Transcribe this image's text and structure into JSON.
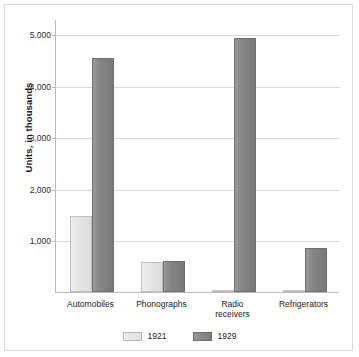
{
  "chart_data": {
    "type": "bar",
    "title": "",
    "xlabel": "",
    "ylabel": "Units, in thousands",
    "ylim": [
      0,
      5300
    ],
    "grid": true,
    "legend_position": "bottom",
    "categories": [
      "Automobiles",
      "Phonographs",
      "Radio\nreceivers",
      "Refrigerators"
    ],
    "ytick_labels": [
      "5,000",
      "4,000",
      "3,000",
      "2,000",
      "1,000"
    ],
    "ytick_values": [
      5000,
      4000,
      3000,
      2000,
      1000
    ],
    "series": [
      {
        "name": "1921",
        "color": "#e6e6e6",
        "values": [
          1480,
          590,
          10,
          5
        ]
      },
      {
        "name": "1929",
        "color": "#808080",
        "values": [
          4540,
          600,
          4930,
          850
        ]
      }
    ]
  },
  "legend": {
    "items": [
      {
        "label": "1921"
      },
      {
        "label": "1929"
      }
    ]
  }
}
